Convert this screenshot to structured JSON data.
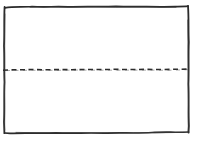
{
  "figure": {
    "kind": "hand-drawn-sketch",
    "background_color": "#ffffff",
    "ink_color": "#2b2b2b",
    "canvas": {
      "width": 198,
      "height": 141
    },
    "labels": [],
    "shapes": [
      {
        "name": "outer-rectangle",
        "type": "rectangle",
        "stroke_style": "solid",
        "stroke_color": "#2b2b2b",
        "stroke_width": 1.6,
        "fill": "none",
        "bounds": {
          "x": 4,
          "y": 6,
          "width": 185,
          "height": 127
        },
        "path": "M5.2,7.6 C24,6.4 44,6.0 63,6.3 C88,6.0 112,6.6 136,6.2 C154,6.4 172,6.0 187.6,6.4 L188.4,26 C188.0,44 188.8,62 188.2,80 C188.6,98 188.0,116 188.4,131.6 C168,132.2 148,131.4 128,132.2 C104,131.6 80,132.6 56,132.0 C38,132.6 20,132.0 5.0,132.6 C4.4,114 5.0,96 4.4,78 C4.8,60 4.2,42 4.8,24 Z"
      },
      {
        "name": "horizontal-divider",
        "type": "line",
        "stroke_style": "dashed",
        "stroke_color": "#2b2b2b",
        "stroke_width": 1.5,
        "dash_pattern": [
          5,
          3.5
        ],
        "from": {
          "x": 3,
          "y": 69
        },
        "to": {
          "x": 190,
          "y": 69
        },
        "path": "M3,70.0 C22,69.4 41,69.8 60,69.2 C80,69.6 100,69.0 120,69.4 C142,68.8 164,69.4 190,68.9"
      }
    ]
  }
}
